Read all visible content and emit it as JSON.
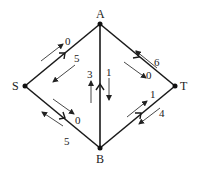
{
  "diagram": {
    "type": "flow-network",
    "colors": {
      "edge": "#1a1a1a",
      "flow_arrow": "#333333",
      "text": "#222222",
      "background": "#ffffff"
    },
    "nodes": [
      {
        "id": "A",
        "label": "A",
        "x": 100,
        "y": 24
      },
      {
        "id": "S",
        "label": "S",
        "x": 25,
        "y": 86
      },
      {
        "id": "T",
        "label": "T",
        "x": 175,
        "y": 86
      },
      {
        "id": "B",
        "label": "B",
        "x": 100,
        "y": 148
      }
    ],
    "edges": [
      {
        "from": "S",
        "to": "A",
        "forward_flow": "0",
        "backward_flow": "5"
      },
      {
        "from": "A",
        "to": "T",
        "forward_flow": "0",
        "backward_flow": "6"
      },
      {
        "from": "S",
        "to": "B",
        "forward_flow": "0",
        "backward_flow": "5"
      },
      {
        "from": "B",
        "to": "T",
        "forward_flow": "1",
        "backward_flow": "4"
      },
      {
        "from": "B",
        "to": "A",
        "forward_flow": "3",
        "backward_flow": "1"
      }
    ],
    "labels": {
      "A": "A",
      "S": "S",
      "T": "T",
      "B": "B",
      "sa_fwd": "0",
      "sa_bwd": "5",
      "at_fwd": "0",
      "at_bwd": "6",
      "sb_fwd": "0",
      "sb_bwd": "5",
      "bt_fwd": "1",
      "bt_bwd": "4",
      "ba_up": "3",
      "ba_down": "1"
    }
  }
}
